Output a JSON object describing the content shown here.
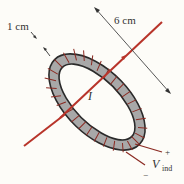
{
  "diagram": {
    "type": "toroid-with-wire",
    "labels": {
      "thickness": "1 cm",
      "diameter": "6 cm",
      "current": "I",
      "voltage_symbol": "V",
      "voltage_subscript": "ind",
      "plus": "+",
      "minus": "−"
    },
    "colors": {
      "background": "#fdfcf8",
      "toroid_fill": "#a8a8a8",
      "toroid_outline": "#2a2a2a",
      "winding": "#8b2a22",
      "wire": "#b8342a",
      "dimension_line": "#444444",
      "text": "#333333"
    }
  }
}
